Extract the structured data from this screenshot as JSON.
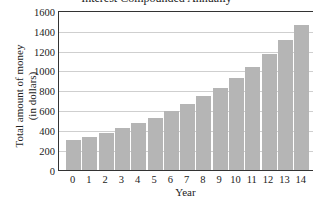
{
  "chart_data": {
    "type": "bar",
    "title": "Interest Compounded Annually",
    "xlabel": "Year",
    "ylabel": "Total amount of money (in dollars)",
    "ylabel_lines": [
      "Total amount of money",
      "(in dollars)"
    ],
    "categories": [
      "0",
      "1",
      "2",
      "3",
      "4",
      "5",
      "6",
      "7",
      "8",
      "9",
      "10",
      "11",
      "12",
      "13",
      "14"
    ],
    "values": [
      300,
      336,
      376,
      421,
      472,
      529,
      592,
      663,
      743,
      832,
      932,
      1044,
      1169,
      1309,
      1466
    ],
    "ylim": [
      0,
      1600
    ],
    "yticks": [
      0,
      200,
      400,
      600,
      800,
      1000,
      1200,
      1400,
      1600
    ],
    "grid": true,
    "legend": null,
    "bar_color": "#b5b5b5"
  }
}
